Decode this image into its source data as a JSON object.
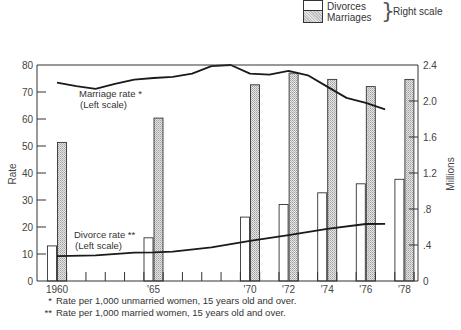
{
  "legend": {
    "divorces_label": "Divorces",
    "marriages_label": "Marriages",
    "scale_label": "Right scale"
  },
  "footnotes": {
    "single_mark": "*",
    "single_text": "Rate per 1,000 unmarried women, 15 years old and over.",
    "double_mark": "**",
    "double_text": "Rate per 1,000 married women, 15 years old and over."
  },
  "annotations": {
    "marriage_rate_line1": "Marriage rate *",
    "marriage_rate_line2": "(Left scale)",
    "divorce_rate_line1": "Divorce rate **",
    "divorce_rate_line2": "(Left scale)"
  },
  "colors": {
    "axis": "#333333",
    "line": "#1a1a1a",
    "divorce_bar_fill": "#ffffff",
    "marriage_bar_fill": "#d3d3d3"
  },
  "chart_data": {
    "type": "bar",
    "title": "",
    "xlabel": "",
    "ylabel": "Rate",
    "ylabel_right": "Millions",
    "ylim": [
      0,
      80
    ],
    "ylim_right": [
      0,
      2.4
    ],
    "yticks": [
      0,
      10,
      20,
      30,
      40,
      50,
      60,
      70,
      80
    ],
    "yticks_right": [
      "0",
      ".4",
      ".8",
      "1.2",
      "1.6",
      "2.0",
      "2.4"
    ],
    "xtick_labels": [
      {
        "year": 1960,
        "label": "1960"
      },
      {
        "year": 1965,
        "label": "'65"
      },
      {
        "year": 1970,
        "label": "'70"
      },
      {
        "year": 1972,
        "label": "'72"
      },
      {
        "year": 1974,
        "label": "'74"
      },
      {
        "year": 1976,
        "label": "'76"
      },
      {
        "year": 1978,
        "label": "'78"
      }
    ],
    "categories": [
      "1960",
      "1965",
      "1970",
      "1972",
      "1974",
      "1976",
      "1978"
    ],
    "series": [
      {
        "name": "Divorces",
        "axis": "right",
        "kind": "bar",
        "unit": "millions",
        "values": [
          0.39,
          0.48,
          0.71,
          0.85,
          0.98,
          1.08,
          1.13
        ]
      },
      {
        "name": "Marriages",
        "axis": "right",
        "kind": "bar",
        "unit": "millions",
        "values": [
          1.54,
          1.81,
          2.18,
          2.31,
          2.24,
          2.16,
          2.24
        ]
      },
      {
        "name": "Marriage rate *",
        "axis": "left",
        "kind": "line",
        "x": [
          1960,
          1961,
          1962,
          1963,
          1964,
          1965,
          1966,
          1967,
          1968,
          1969,
          1970,
          1971,
          1972,
          1973,
          1974,
          1975,
          1976,
          1977
        ],
        "values": [
          73.5,
          72.2,
          71.2,
          73.0,
          74.6,
          75.2,
          75.6,
          76.8,
          79.6,
          80.0,
          76.8,
          76.4,
          77.8,
          76.2,
          72.0,
          67.8,
          66.0,
          63.6
        ]
      },
      {
        "name": "Divorce rate **",
        "axis": "left",
        "kind": "line",
        "x": [
          1960,
          1962,
          1964,
          1965,
          1966,
          1968,
          1970,
          1972,
          1974,
          1976,
          1977
        ],
        "values": [
          9.2,
          9.5,
          10.5,
          10.6,
          10.9,
          12.5,
          14.9,
          17.0,
          19.3,
          21.1,
          21.2
        ]
      }
    ],
    "grid": false,
    "legend_position": "top-right"
  }
}
